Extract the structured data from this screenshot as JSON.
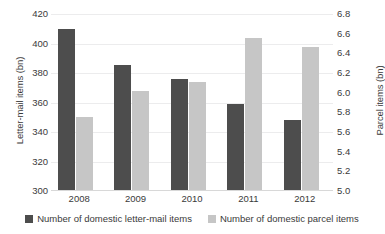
{
  "chart_data": {
    "type": "bar",
    "title": "",
    "xlabel": "",
    "categories": [
      "2008",
      "2009",
      "2010",
      "2011",
      "2012"
    ],
    "grid": true,
    "legend_position": "bottom",
    "series": [
      {
        "name": "Number of domestic letter-mail items",
        "axis": "left",
        "color": "#4d4d4d",
        "values": [
          410,
          385.5,
          376,
          359,
          348
        ]
      },
      {
        "name": "Number of domestic parcel items",
        "axis": "right",
        "color": "#c6c6c6",
        "values": [
          5.75,
          6.02,
          6.11,
          6.56,
          6.46
        ]
      }
    ],
    "y_left": {
      "label": "Letter-mail items (bn)",
      "ticks": [
        420,
        400,
        380,
        360,
        340,
        320,
        300
      ],
      "tick_labels": [
        "420",
        "400",
        "380",
        "360",
        "340",
        "320",
        "300"
      ],
      "min": 300,
      "max": 420
    },
    "y_right": {
      "label": "Parcel items (bn)",
      "ticks": [
        6.8,
        6.6,
        6.4,
        6.2,
        6.0,
        5.8,
        5.6,
        5.4,
        5.2,
        5.0
      ],
      "tick_labels": [
        "6.8",
        "6.6",
        "6.4",
        "6.2",
        "6.0",
        "5.8",
        "5.6",
        "5.4",
        "5.2",
        "5.0"
      ],
      "min": 5.0,
      "max": 6.8
    }
  },
  "legend": {
    "items": [
      {
        "label": "Number of domestic letter-mail items",
        "color": "#4d4d4d"
      },
      {
        "label": "Number of domestic parcel items",
        "color": "#c6c6c6"
      }
    ]
  }
}
